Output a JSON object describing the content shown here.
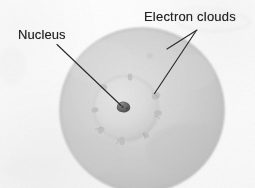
{
  "figure": {
    "background_color": "#fdfdfd",
    "width": 255,
    "height": 188
  },
  "labels": {
    "nucleus": "Nucleus",
    "electron_clouds": "Electron clouds"
  },
  "colors": {
    "text": "#242424",
    "leader_line": "#2b2b2b",
    "outer_cloud_edge": "#b8b8b8",
    "outer_cloud_fill": "#cfcfcf",
    "inner_cloud_fill": "#d9d9d9",
    "nucleus_fill": "#6d6d6d",
    "nucleus_edge": "#4a4a4a"
  },
  "geometry": {
    "outer_cloud": {
      "cx": 142,
      "cy": 110,
      "r": 82
    },
    "inner_cloud": {
      "cx": 126,
      "cy": 108,
      "r": 33
    },
    "nucleus": {
      "cx": 124,
      "cy": 106,
      "r": 6
    },
    "leader_nucleus": {
      "x1": 57,
      "y1": 44,
      "x2": 122,
      "y2": 105
    },
    "leader_electron_a": {
      "x1": 196,
      "y1": 31,
      "x2": 155,
      "y2": 93
    },
    "leader_electron_b": {
      "x1": 197,
      "y1": 30,
      "x2": 168,
      "y2": 49
    }
  },
  "annotations": {
    "nucleus_points_to": "nucleus",
    "electron_clouds_points_to": "electron-cloud-boundary"
  }
}
